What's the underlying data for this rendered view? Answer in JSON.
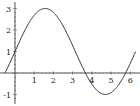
{
  "chart_data": {
    "type": "line",
    "title": "",
    "xlabel": "",
    "ylabel": "",
    "function": "1 + 2 sin(x)",
    "xlim": [
      -0.6,
      6.4
    ],
    "ylim": [
      -1.2,
      3.2
    ],
    "grid": false,
    "legend": null,
    "x_ticks": [
      1,
      2,
      3,
      4,
      5,
      6
    ],
    "y_ticks": [
      -1,
      1,
      2,
      3
    ],
    "x_tick_labels": [
      "1",
      "2",
      "3",
      "4",
      "5",
      "6"
    ],
    "y_tick_labels": [
      "-1",
      "1",
      "2",
      "3"
    ],
    "series": [
      {
        "name": "y",
        "color": "#333333",
        "x": [
          -0.52,
          0,
          0.5,
          1.0,
          1.57,
          2.0,
          2.5,
          3.0,
          3.67,
          4.0,
          4.71,
          5.0,
          5.5,
          5.76,
          6.28
        ],
        "y": [
          0,
          1,
          1.96,
          2.68,
          3,
          2.82,
          2.2,
          1.28,
          0,
          -0.51,
          -1,
          -0.92,
          -0.41,
          0,
          1
        ]
      }
    ]
  }
}
